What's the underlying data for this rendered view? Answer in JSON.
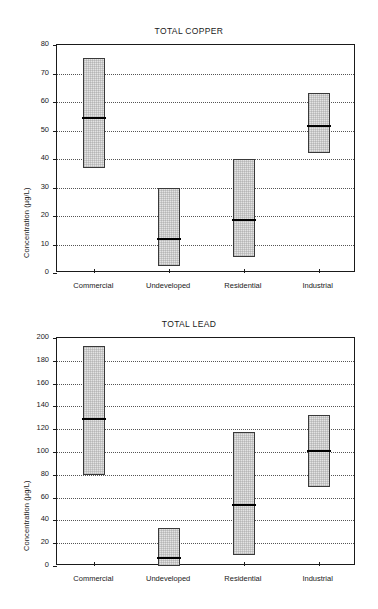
{
  "figure": {
    "width": 378,
    "height": 609,
    "background": "#ffffff",
    "ink_color": "#1a1a1a",
    "box_fill": "#e3e3e3",
    "box_edge": "#3a3a3a",
    "median_color": "#000000"
  },
  "charts": [
    {
      "id": "copper",
      "title": "TOTAL COPPER",
      "ylabel": "Concentration (µg/L)",
      "xlabel": "",
      "ylim": [
        0,
        80
      ],
      "yticks": [
        0,
        10,
        20,
        30,
        40,
        50,
        60,
        70,
        80
      ],
      "ytick_labels": [
        "0",
        "10",
        "20",
        "30",
        "40",
        "50",
        "60",
        "70",
        "80"
      ],
      "grid": true,
      "categories": [
        "Commercial",
        "Undeveloped",
        "Residential",
        "Industrial"
      ],
      "boxes": [
        {
          "category": "Commercial",
          "low": 37.0,
          "median": 54.5,
          "high": 75.5
        },
        {
          "category": "Undeveloped",
          "low": 2.5,
          "median": 12.0,
          "high": 30.0
        },
        {
          "category": "Residential",
          "low": 5.5,
          "median": 18.5,
          "high": 40.0
        },
        {
          "category": "Industrial",
          "low": 42.0,
          "median": 51.5,
          "high": 63.0
        }
      ]
    },
    {
      "id": "lead",
      "title": "TOTAL LEAD",
      "ylabel": "Concentration (µg/L)",
      "xlabel": "",
      "ylim": [
        0,
        200
      ],
      "yticks": [
        0,
        20,
        40,
        60,
        80,
        100,
        120,
        140,
        160,
        180,
        200
      ],
      "ytick_labels": [
        "0",
        "20",
        "40",
        "60",
        "80",
        "100",
        "120",
        "140",
        "160",
        "180",
        "200"
      ],
      "grid": true,
      "categories": [
        "Commercial",
        "Undeveloped",
        "Residential",
        "Industrial"
      ],
      "boxes": [
        {
          "category": "Commercial",
          "low": 80.0,
          "median": 129.0,
          "high": 193.0
        },
        {
          "category": "Undeveloped",
          "low": 0.0,
          "median": 7.0,
          "high": 33.5
        },
        {
          "category": "Residential",
          "low": 10.0,
          "median": 53.5,
          "high": 117.5
        },
        {
          "category": "Industrial",
          "low": 69.0,
          "median": 100.5,
          "high": 132.5
        }
      ]
    }
  ],
  "chart_data": [
    {
      "type": "bar",
      "chart_kind": "range-bar-with-median",
      "title": "TOTAL COPPER",
      "xlabel": "",
      "ylabel": "Concentration (µg/L)",
      "ylim": [
        0,
        80
      ],
      "yticks": [
        0,
        10,
        20,
        30,
        40,
        50,
        60,
        70,
        80
      ],
      "grid": true,
      "legend": null,
      "categories": [
        "Commercial",
        "Undeveloped",
        "Residential",
        "Industrial"
      ],
      "series": [
        {
          "name": "minimum",
          "values": [
            37.0,
            2.5,
            5.5,
            42.0
          ]
        },
        {
          "name": "median",
          "values": [
            54.5,
            12.0,
            18.5,
            51.5
          ]
        },
        {
          "name": "maximum",
          "values": [
            75.5,
            30.0,
            40.0,
            63.0
          ]
        }
      ]
    },
    {
      "type": "bar",
      "chart_kind": "range-bar-with-median",
      "title": "TOTAL LEAD",
      "xlabel": "",
      "ylabel": "Concentration (µg/L)",
      "ylim": [
        0,
        200
      ],
      "yticks": [
        0,
        20,
        40,
        60,
        80,
        100,
        120,
        140,
        160,
        180,
        200
      ],
      "grid": true,
      "legend": null,
      "categories": [
        "Commercial",
        "Undeveloped",
        "Residential",
        "Industrial"
      ],
      "series": [
        {
          "name": "minimum",
          "values": [
            80.0,
            0.0,
            10.0,
            69.0
          ]
        },
        {
          "name": "median",
          "values": [
            129.0,
            7.0,
            53.5,
            100.5
          ]
        },
        {
          "name": "maximum",
          "values": [
            193.0,
            33.5,
            117.5,
            132.5
          ]
        }
      ]
    }
  ]
}
